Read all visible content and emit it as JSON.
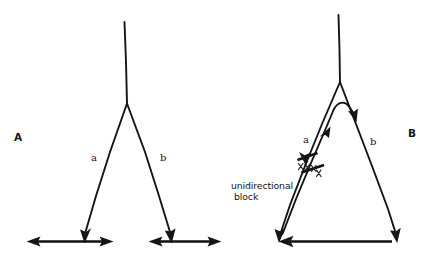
{
  "figure": {
    "title": "",
    "background_color": "#ffffff",
    "ink_color": "#151515",
    "width": 430,
    "height": 255
  },
  "panels": [
    {
      "id": "A",
      "letter": "A",
      "description": "normal bidirectional conduction through a bifurcating fiber",
      "branch_labels": {
        "left": "a",
        "right": "b"
      }
    },
    {
      "id": "B",
      "letter": "B",
      "description": "reentry caused by unidirectional block in branch a",
      "branch_labels": {
        "left": "a",
        "right": "b"
      },
      "annotation_line1": "unidirectional",
      "annotation_line2": "block"
    }
  ]
}
